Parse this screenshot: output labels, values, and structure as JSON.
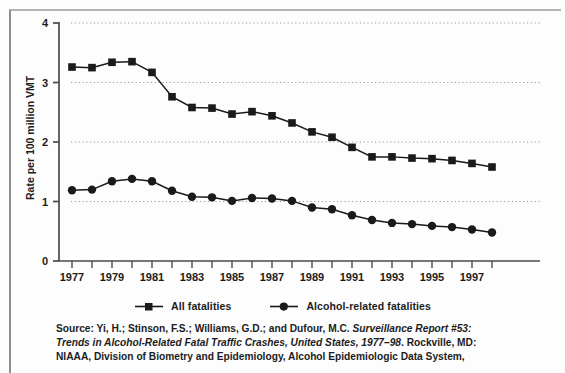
{
  "chart_data": {
    "type": "line",
    "title": "",
    "subtitle": "",
    "xlabel": "",
    "ylabel": "Rate per 100 million VMT",
    "xlim": [
      1977,
      1998
    ],
    "ylim": [
      0,
      4
    ],
    "yticks": [
      0,
      1,
      2,
      3,
      4
    ],
    "ytick_labels": [
      "0",
      "1",
      "2",
      "3",
      "4"
    ],
    "x": [
      1977,
      1978,
      1979,
      1980,
      1981,
      1982,
      1983,
      1984,
      1985,
      1986,
      1987,
      1988,
      1989,
      1990,
      1991,
      1992,
      1993,
      1994,
      1995,
      1996,
      1997,
      1998
    ],
    "xtick_labels": [
      "1977",
      "",
      "1979",
      "",
      "1981",
      "",
      "1983",
      "",
      "1985",
      "",
      "1987",
      "",
      "1989",
      "",
      "1991",
      "",
      "1993",
      "",
      "1995",
      "",
      "1997",
      ""
    ],
    "xtick_labels_shown": [
      "1977",
      "1979",
      "1981",
      "1983",
      "1985",
      "1987",
      "1989",
      "1991",
      "1993",
      "1995",
      "1997"
    ],
    "grid": true,
    "grid_style": "dotted-horizontal",
    "legend_position": "bottom-center",
    "series": [
      {
        "name": "All fatalities",
        "marker": "square",
        "color": "#1a1a1a",
        "values": [
          3.26,
          3.25,
          3.34,
          3.35,
          3.17,
          2.76,
          2.58,
          2.57,
          2.47,
          2.51,
          2.44,
          2.32,
          2.17,
          2.08,
          1.91,
          1.75,
          1.75,
          1.73,
          1.72,
          1.69,
          1.64,
          1.58
        ]
      },
      {
        "name": "Alcohol-related fatalities",
        "marker": "circle",
        "color": "#1a1a1a",
        "values": [
          1.19,
          1.2,
          1.34,
          1.38,
          1.34,
          1.18,
          1.08,
          1.07,
          1.01,
          1.06,
          1.05,
          1.01,
          0.9,
          0.87,
          0.77,
          0.69,
          0.64,
          0.62,
          0.59,
          0.57,
          0.53,
          0.48
        ]
      }
    ]
  },
  "legend": {
    "entries": [
      {
        "label": "All fatalities",
        "marker": "square"
      },
      {
        "label": "Alcohol-related fatalities",
        "marker": "circle"
      }
    ]
  },
  "source": {
    "line1_plain": "Source: Yi, H.; Stinson, F.S.; Williams, G.D.; and Dufour, M.C. ",
    "line1_italic": "Surveillance Report #53:",
    "line2_italic": "Trends in Alcohol-Related Fatal Traffic Crashes, United States, 1977–98",
    "line2_plain": ". Rockville, MD:",
    "line3_plain": "NIAAA, Division of Biometry and Epidemiology, Alcohol Epidemiologic Data System,"
  },
  "colors": {
    "ink": "#1a1a1a",
    "axis": "#4a4a4a",
    "grid": "#9a9a9a",
    "page": "#fdfdfd",
    "frame": "#8e8e8e"
  }
}
